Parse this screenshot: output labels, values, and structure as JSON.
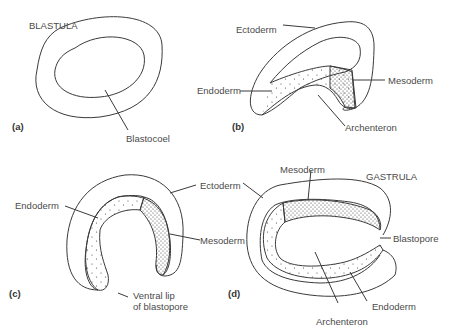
{
  "panels": {
    "a": {
      "letter": "(a)",
      "stage": "BLASTULA",
      "labels": {
        "blastocoel": "Blastocoel"
      }
    },
    "b": {
      "letter": "(b)",
      "labels": {
        "ectoderm": "Ectoderm",
        "endoderm": "Endoderm",
        "mesoderm": "Mesoderm",
        "archenteron": "Archenteron"
      }
    },
    "c": {
      "letter": "(c)",
      "labels": {
        "ectoderm": "Ectoderm",
        "endoderm": "Endoderm",
        "mesoderm": "Mesoderm",
        "ventral_lip_1": "Ventral lip",
        "ventral_lip_2": "of blastopore"
      }
    },
    "d": {
      "letter": "(d)",
      "stage": "GASTRULA",
      "labels": {
        "ectoderm": "Ectoderm",
        "mesoderm": "Mesoderm",
        "endoderm": "Endoderm",
        "archenteron": "Archenteron",
        "blastopore": "Blastopore"
      }
    }
  },
  "colors": {
    "line": "#3a3a3a",
    "text": "#4a4a4a",
    "background": "#ffffff"
  }
}
